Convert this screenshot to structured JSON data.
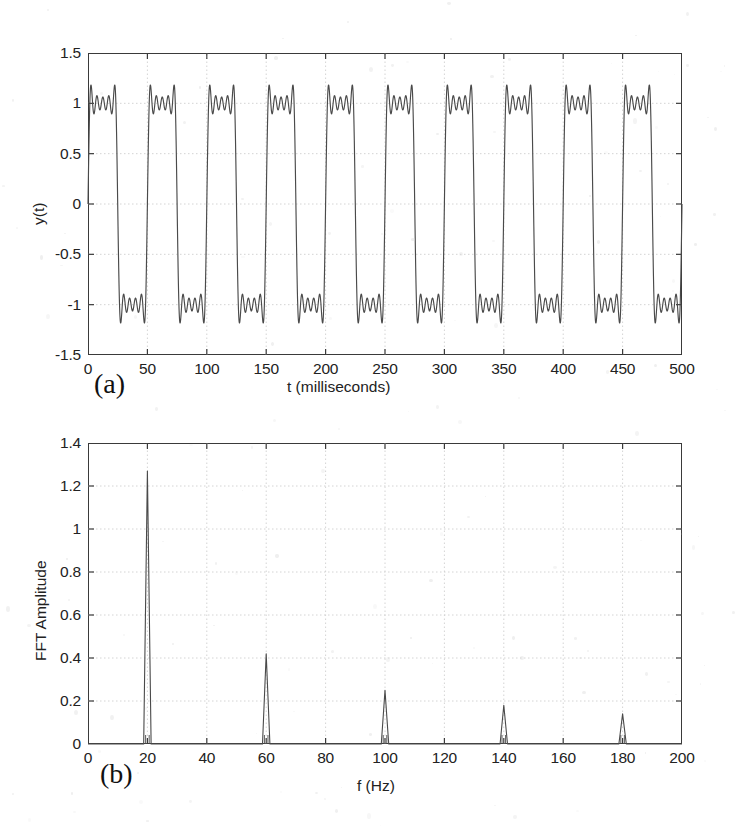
{
  "figure": {
    "background_color": "#ffffff",
    "line_color": "#4a4a4a",
    "axis_color": "#3a3a3a",
    "grid_color": "#cfcfcf"
  },
  "panels": [
    {
      "tag": "(a)",
      "tag_name": "panel-label-a"
    },
    {
      "tag": "(b)",
      "tag_name": "panel-label-b"
    }
  ],
  "chart_data": [
    {
      "type": "line",
      "id": "time-domain-square-wave",
      "title": "",
      "panel_label": "(a)",
      "xlabel": "t (milliseconds)",
      "ylabel": "y(t)",
      "xlim": [
        0,
        500
      ],
      "ylim": [
        -1.5,
        1.5
      ],
      "xticks": [
        0,
        50,
        100,
        150,
        200,
        250,
        300,
        350,
        400,
        450,
        500
      ],
      "xtick_labels": [
        "0",
        "50",
        "100",
        "150",
        "200",
        "250",
        "300",
        "350",
        "400",
        "450",
        "500"
      ],
      "yticks": [
        -1.5,
        -1,
        -0.5,
        0,
        0.5,
        1,
        1.5
      ],
      "ytick_labels": [
        "-1.5",
        "-1",
        "-0.5",
        "0",
        "0.5",
        "1",
        "1.5"
      ],
      "grid": true,
      "description": "Odd-harmonic Fourier series approximation of a 20 Hz square wave (harmonics at 20, 60, 100, 140, 180 Hz) showing Gibbs ringing on the flat tops.",
      "series": [
        {
          "name": "y(t)",
          "fundamental_hz": 20,
          "harmonics_hz": [
            20,
            60,
            100,
            140,
            180
          ],
          "harmonic_amplitudes": [
            1.273,
            0.424,
            0.255,
            0.182,
            0.141
          ],
          "period_ms": 50,
          "plateau_high": 1.0,
          "plateau_low": -1.0,
          "overshoot_peak": 1.19,
          "undershoot_peak": -1.19
        }
      ]
    },
    {
      "type": "line",
      "id": "fft-amplitude-spectrum",
      "title": "",
      "panel_label": "(b)",
      "xlabel": "f (Hz)",
      "ylabel": "FFT Amplitude",
      "xlim": [
        0,
        200
      ],
      "ylim": [
        0,
        1.4
      ],
      "xticks": [
        0,
        20,
        40,
        60,
        80,
        100,
        120,
        140,
        160,
        180,
        200
      ],
      "xtick_labels": [
        "0",
        "20",
        "40",
        "60",
        "80",
        "100",
        "120",
        "140",
        "160",
        "180",
        "200"
      ],
      "yticks": [
        0,
        0.2,
        0.4,
        0.6,
        0.8,
        1,
        1.2,
        1.4
      ],
      "ytick_labels": [
        "0",
        "0.2",
        "0.4",
        "0.6",
        "0.8",
        "1",
        "1.2",
        "1.4"
      ],
      "grid": true,
      "description": "FFT magnitude spectrum with spectral lines only at the odd harmonics of 20 Hz.",
      "peaks": [
        {
          "f": 20,
          "amplitude": 1.27
        },
        {
          "f": 60,
          "amplitude": 0.42
        },
        {
          "f": 100,
          "amplitude": 0.25
        },
        {
          "f": 140,
          "amplitude": 0.18
        },
        {
          "f": 180,
          "amplitude": 0.14
        }
      ]
    }
  ]
}
